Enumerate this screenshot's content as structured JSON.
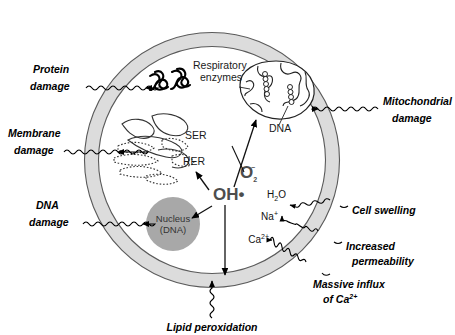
{
  "figure": {
    "type": "cell-injury-diagram",
    "title_visible": false,
    "colors": {
      "membrane_band": "#dcdcdc",
      "membrane_outline": "#555555",
      "nucleus_fill": "#a8a8a8",
      "radical_text": "#4d4d4d",
      "bilayer": "#8c8c8c",
      "background": "#ffffff",
      "ink": "#000000"
    }
  },
  "damage_labels": {
    "protein": {
      "line1": "Protein",
      "line2": "damage"
    },
    "membrane": {
      "line1": "Membrane",
      "line2": "damage"
    },
    "dna": {
      "line1": "DNA",
      "line2": "damage"
    },
    "mitochondrial": {
      "line1": "Mitochondrial",
      "line2": "damage"
    },
    "lipid_peroxidation": "Lipid peroxidation"
  },
  "consequence_labels": {
    "cell_swelling": "Cell swelling",
    "increased_permeability": {
      "line1": "Increased",
      "line2": "permeability"
    },
    "massive_influx": {
      "line1": "Massive influx",
      "line2": "of Ca",
      "sup": "2+"
    }
  },
  "organelles": {
    "respiratory_enzymes": {
      "line1": "Respiratory",
      "line2": "enzymes"
    },
    "mito_dna": "DNA",
    "ser": "SER",
    "rer": "RER",
    "nucleus": {
      "line1": "Nucleus",
      "line2": "(DNA)"
    }
  },
  "radicals": {
    "superoxide": {
      "base": "O",
      "sub": "2",
      "sup": "–"
    },
    "hydroxyl": "OH•"
  },
  "ions": {
    "water": {
      "base": "H",
      "sub": "2",
      "tail": "O"
    },
    "sodium": {
      "base": "Na",
      "sup": "+"
    },
    "calcium": {
      "base": "Ca",
      "sup": "2+"
    }
  }
}
